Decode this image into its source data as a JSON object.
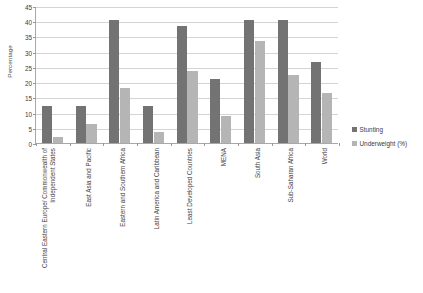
{
  "chart_data": {
    "type": "bar",
    "title": "",
    "xlabel": "",
    "ylabel": "Percentage",
    "ylim": [
      0,
      45
    ],
    "ytick_step": 5,
    "yticks": [
      0,
      5,
      10,
      15,
      20,
      25,
      30,
      35,
      40,
      45
    ],
    "grid": true,
    "legend_position": "right",
    "categories": [
      "Central Eastern Europe/ Commonwealth of Independent States",
      "East Asia and Pacific",
      "Eastern and Southern Africa",
      "Latin America and Caribbean",
      "Least Developed Countries",
      "MENA",
      "South Asia",
      "Sub-Saharan Africa",
      "World"
    ],
    "series": [
      {
        "name": "Stunting",
        "color": "#737373",
        "values": [
          12,
          12,
          40.5,
          12.3,
          38.3,
          21,
          40.5,
          40.5,
          26.5
        ]
      },
      {
        "name": "Underweight (%)",
        "color": "#b5b5b5",
        "values": [
          2,
          6.2,
          18.2,
          3.5,
          23.5,
          9,
          33.5,
          22.3,
          16.5
        ]
      }
    ]
  },
  "axis": {
    "y_title": "Percentage"
  },
  "legend": {
    "items": [
      {
        "label": "Stunting",
        "color": "#737373"
      },
      {
        "label": "Underweight (%)",
        "color": "#b5b5b5"
      }
    ]
  }
}
